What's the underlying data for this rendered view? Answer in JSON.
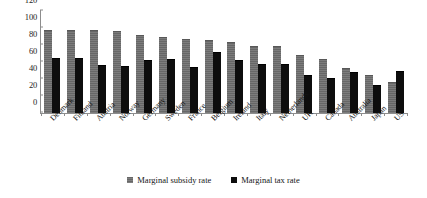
{
  "chart_data": {
    "type": "bar",
    "title": "",
    "subtitle": "",
    "xlabel": "",
    "ylabel": "",
    "ylim": [
      0,
      120
    ],
    "yticks": [
      0,
      20,
      40,
      60,
      80,
      100,
      120
    ],
    "grid": false,
    "legend_position": "bottom",
    "categories": [
      "Denmark",
      "Finland",
      "Austria",
      "Norway",
      "Germany",
      "Sweden",
      "France",
      "Belgium",
      "Ireland",
      "Italy",
      "Netherlands",
      "UK",
      "Canada",
      "Australia",
      "Japan",
      "US"
    ],
    "series": [
      {
        "name": "Marginal subsidy rate",
        "color": "#6d6d6d",
        "values": [
          97,
          97,
          96,
          95,
          91,
          88,
          86,
          85,
          82,
          78,
          78,
          67,
          62,
          52,
          43,
          35
        ]
      },
      {
        "name": "Marginal tax rate",
        "color": "#0d0d0d",
        "values": [
          63,
          63,
          55,
          54,
          61,
          62,
          53,
          71,
          61,
          57,
          57,
          43,
          40,
          47,
          32,
          48
        ]
      }
    ]
  },
  "legend": {
    "items": [
      {
        "label": "Marginal subsidy rate",
        "swatch": "subsidy"
      },
      {
        "label": "Marginal tax rate",
        "swatch": "tax"
      }
    ]
  }
}
